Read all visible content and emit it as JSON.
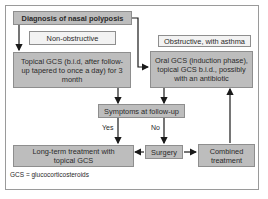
{
  "diagram": {
    "nodes": {
      "diagnosis": "Diagnosis of nasal polyposis",
      "non_obstructive": "Non-obstructive",
      "obstructive": "Obstructive, with asthma",
      "topical_gcs": "Topical GCS (b.i.d, after follow-up tapered to once a day) for 3 month",
      "oral_gcs": "Oral GCS (induction phase), topical GCS b.i.d., possibly with an antibiotic",
      "symptoms": "Symptoms at follow-up",
      "long_term": "Long-term treatment with topical GCS",
      "surgery": "Surgery",
      "combined": "Combined treatment"
    },
    "edges": {
      "yes_label": "Yes",
      "no_label": "No"
    },
    "footnote": "GCS = glucocorticosteroids",
    "colors": {
      "box_fill": "#bdbdbd",
      "label_fill": "#f2f2f2",
      "border": "#8e8e8e",
      "arrow": "#1a1a1a"
    }
  }
}
